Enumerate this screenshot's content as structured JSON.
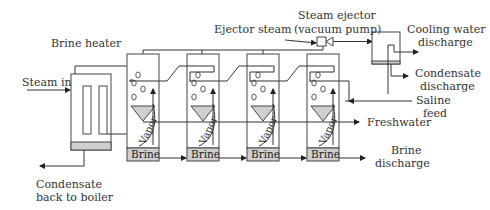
{
  "diagram": {
    "type": "multi-effect distillation process flow",
    "labels": {
      "brine_heater": "Brine heater",
      "steam_in": "Steam in",
      "condensate_back_line1": "Condensate",
      "condensate_back_line2": "back to boiler",
      "ejector_steam": "Ejector steam",
      "steam_ejector_line1": "Steam ejector",
      "steam_ejector_line2": "(vacuum pump)",
      "cooling_water_line1": "Cooling water",
      "cooling_water_line2": "discharge",
      "condensate_discharge_line1": "Condensate",
      "condensate_discharge_line2": "discharge",
      "saline_feed_line1": "Saline",
      "saline_feed_line2": "feed",
      "freshwater": "Freshwater",
      "brine_discharge_line1": "Brine",
      "brine_discharge_line2": "discharge"
    },
    "effects": [
      {
        "brine_label": "Brine",
        "vapor_label": "Vapor"
      },
      {
        "brine_label": "Brine",
        "vapor_label": "Vapor"
      },
      {
        "brine_label": "Brine",
        "vapor_label": "Vapor"
      },
      {
        "brine_label": "Brine",
        "vapor_label": "Vapor"
      }
    ],
    "colors": {
      "line": "#333333",
      "fill_grey": "#cfcfcf",
      "background": "#ffffff"
    }
  }
}
